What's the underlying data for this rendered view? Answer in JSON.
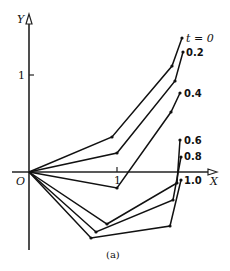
{
  "figure": {
    "caption": "(a)",
    "axes": {
      "x_label": "X",
      "y_label": "Y",
      "origin_label": "O",
      "x_tick_label": "1",
      "y_tick_label": "1"
    },
    "curves": [
      {
        "label": "t = 0",
        "points": [
          [
            29,
            172
          ],
          [
            112,
            137
          ],
          [
            172,
            66
          ],
          [
            182,
            38
          ]
        ]
      },
      {
        "label": "0.2",
        "points": [
          [
            29,
            172
          ],
          [
            117,
            153
          ],
          [
            175,
            81
          ],
          [
            183,
            52
          ]
        ]
      },
      {
        "label": "0.4",
        "points": [
          [
            29,
            172
          ],
          [
            117,
            224
          ],
          [
            171,
            112
          ],
          [
            180,
            93
          ]
        ]
      },
      {
        "label": "0.6",
        "points": [
          [
            29,
            172
          ],
          [
            107,
            229
          ],
          [
            177,
            183
          ],
          [
            180,
            140
          ]
        ]
      },
      {
        "label": "0.8",
        "points": [
          [
            29,
            172
          ],
          [
            96,
            262
          ],
          [
            173,
            230
          ],
          [
            181,
            195
          ]
        ]
      },
      {
        "label": "1.0",
        "points": [
          [
            29,
            172
          ],
          [
            91,
            270
          ],
          [
            170,
            248
          ],
          [
            181,
            217
          ]
        ]
      }
    ]
  },
  "chart_data": {
    "type": "line",
    "title": "",
    "xlabel": "X",
    "ylabel": "Y",
    "caption": "(a)",
    "series": [
      {
        "name": "t = 0",
        "x": [
          0,
          0.94,
          1.61,
          1.73
        ],
        "y": [
          0,
          0.36,
          1.09,
          1.38
        ]
      },
      {
        "name": "0.2",
        "x": [
          0,
          1.0,
          1.66,
          1.75
        ],
        "y": [
          0,
          0.2,
          0.94,
          1.24
        ]
      },
      {
        "name": "0.4",
        "x": [
          0,
          1.0,
          1.61,
          1.72
        ],
        "y": [
          0,
          -0.55,
          0.62,
          0.81
        ]
      },
      {
        "name": "0.6",
        "x": [
          0,
          0.89,
          1.68,
          1.72
        ],
        "y": [
          0,
          -0.59,
          -0.11,
          0.33
        ]
      },
      {
        "name": "0.8",
        "x": [
          0,
          0.76,
          1.64,
          1.73
        ],
        "y": [
          0,
          -0.93,
          -0.6,
          -0.24
        ]
      },
      {
        "name": "1.0",
        "x": [
          0,
          0.7,
          1.6,
          1.73
        ],
        "y": [
          0,
          -1.01,
          -0.79,
          -0.47
        ]
      }
    ]
  }
}
